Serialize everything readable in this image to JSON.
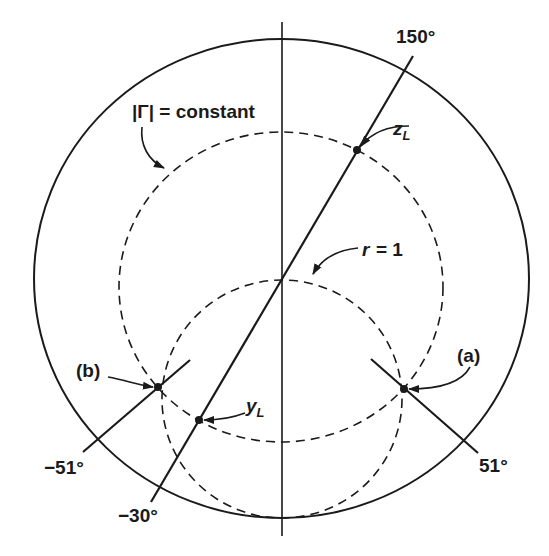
{
  "diagram": {
    "type": "smith-chart-construction",
    "outer_circle": {
      "label": "unit |Γ|=1 boundary"
    },
    "gamma_circle": {
      "label": "|Γ| = constant",
      "style": "dashed"
    },
    "r1_circle": {
      "label": "r = 1",
      "style": "dashed"
    },
    "lines": [
      {
        "id": "line-150",
        "label_top": "150°",
        "label_bottom": "−30°"
      },
      {
        "id": "line-51",
        "label": "51°"
      },
      {
        "id": "line-neg51",
        "label": "−51°"
      }
    ],
    "points": [
      {
        "id": "zL",
        "label_main": "z",
        "label_sub": "L"
      },
      {
        "id": "yL",
        "label_main": "y",
        "label_sub": "L"
      },
      {
        "id": "a",
        "label": "(a)"
      },
      {
        "id": "b",
        "label": "(b)"
      }
    ],
    "colors": {
      "stroke": "#1a1a1a",
      "background": "#ffffff"
    }
  },
  "labels": {
    "gamma_constant": "|Γ| = constant",
    "r_eq": "r = 1",
    "deg150": "150°",
    "deg_neg30": "−30°",
    "deg51": "51°",
    "deg_neg51": "−51°",
    "a": "(a)",
    "b": "(b)",
    "zL_main": "z",
    "zL_sub": "L",
    "yL_main": "y",
    "yL_sub": "L"
  }
}
